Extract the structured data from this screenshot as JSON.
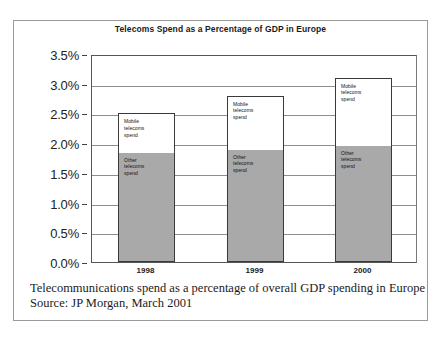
{
  "chart_data": {
    "type": "bar",
    "subtype": "stacked-column",
    "title": "Telecoms Spend as a Percentage of GDP in Europe",
    "xlabel": "",
    "ylabel": "",
    "categories": [
      "1998",
      "1999",
      "2000"
    ],
    "series": [
      {
        "name": "Other telecoms spend",
        "label_text": "Other\ntelecoms\nspend",
        "color": "#a9a9a9",
        "values": [
          1.82,
          1.87,
          1.94
        ]
      },
      {
        "name": "Mobile telecoms spend",
        "label_text": "Mobile\ntelecoms\nspend",
        "color": "#ffffff",
        "values": [
          0.68,
          0.93,
          1.16
        ]
      }
    ],
    "totals": [
      2.5,
      2.8,
      3.1
    ],
    "ylim": [
      0,
      3.5
    ],
    "ytick_step": 0.5,
    "ytick_labels": [
      "0.0%",
      "0.5%",
      "1.0%",
      "1.5%",
      "2.0%",
      "2.5%",
      "3.0%",
      "3.5%"
    ],
    "ytick_values": [
      0.0,
      0.5,
      1.0,
      1.5,
      2.0,
      2.5,
      3.0,
      3.5
    ],
    "grid": true,
    "legend": "inline-segment-labels",
    "value_unit": "percent-of-GDP"
  },
  "chart": {
    "title": "Telecoms Spend as a Percentage of GDP in Europe",
    "segment_labels": {
      "mobile_line1": "Mobile",
      "mobile_line2": "telecoms",
      "mobile_line3": "spend",
      "other_line1": "Other",
      "other_line2": "telecoms",
      "other_line3": "spend"
    }
  },
  "caption": {
    "line1": "Telecommunications spend as a percentage of overall GDP spending in Europe",
    "line2": "Source: JP Morgan, March 2001"
  }
}
